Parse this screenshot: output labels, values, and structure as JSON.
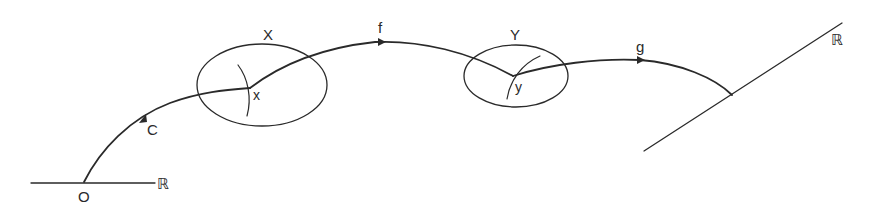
{
  "diagram": {
    "labels": {
      "origin": "O",
      "real_line_left": "ℝ",
      "real_line_right": "ℝ",
      "curve": "C",
      "set_X": "X",
      "point_x": "x",
      "map_f": "f",
      "set_Y": "Y",
      "point_y": "y",
      "map_g": "g"
    },
    "colors": {
      "ink": "#2a2a2a",
      "background": "#ffffff"
    }
  }
}
